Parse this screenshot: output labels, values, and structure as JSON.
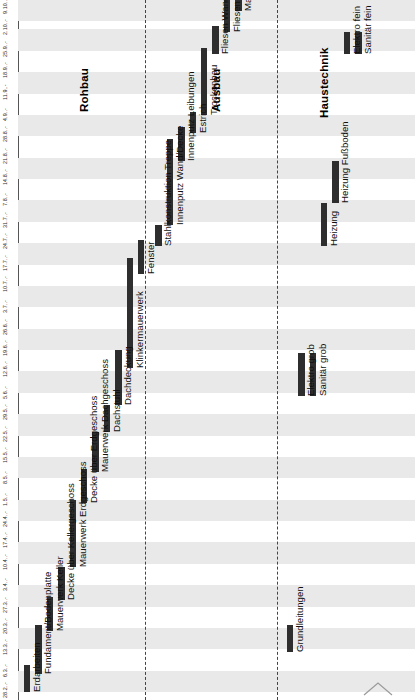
{
  "chart_data": {
    "type": "bar",
    "orientation": "gantt-rotated-90",
    "title": "",
    "xlabel": "",
    "ylabel": "",
    "time_axis": {
      "label": "",
      "ticks": [
        "28.2.",
        "6.3.",
        "13.3.",
        "20.3.",
        "27.3.",
        "3.4.",
        "10.4.",
        "17.4.",
        "24.4.",
        "1.5.",
        "8.5.",
        "15.5.",
        "22.5.",
        "29.5.",
        "5.6.",
        "12.6.",
        "19.6.",
        "26.6.",
        "3.7.",
        "10.7.",
        "17.7.",
        "24.7.",
        "31.7.",
        "7.8.",
        "14.8.",
        "21.8.",
        "28.8.",
        "4.9.",
        "11.9.",
        "18.9.",
        "25.9.",
        "2.10.",
        "9.10."
      ],
      "start": "28.2.",
      "end": "9.10."
    },
    "groups": [
      {
        "name": "Rohbau"
      },
      {
        "name": "Ausbau"
      },
      {
        "name": "Haustechnik"
      }
    ],
    "tasks": [
      {
        "group": "Rohbau",
        "label": "Erdarbeiten",
        "start": "28.2.",
        "end": "9.3."
      },
      {
        "group": "Rohbau",
        "label": "Fundament/Bodenplatte",
        "start": "6.3.",
        "end": "22.3."
      },
      {
        "group": "Rohbau",
        "label": "Mauerwerk Keller",
        "start": "20.3.",
        "end": "31.3."
      },
      {
        "group": "Rohbau",
        "label": "Decke über Kellergeschoss",
        "start": "30.3.",
        "end": "10.4."
      },
      {
        "group": "Rohbau",
        "label": "Mauerwerk Erdgeschoss",
        "start": "10.4.",
        "end": "2.5."
      },
      {
        "group": "Rohbau",
        "label": "Decke über Erdgeschoss",
        "start": "1.5.",
        "end": "12.5."
      },
      {
        "group": "Rohbau",
        "label": "Mauerwerk Dachgeschoss",
        "start": "11.5.",
        "end": "24.5."
      },
      {
        "group": "Rohbau",
        "label": "Dachstuhl",
        "start": "24.5.",
        "end": "2.6."
      },
      {
        "group": "Rohbau",
        "label": "Dachdeckung",
        "start": "2.6.",
        "end": "20.6."
      },
      {
        "group": "Rohbau",
        "label": "Klinkermauerwerk",
        "start": "14.6.",
        "end": "20.7."
      },
      {
        "group": "Rohbau",
        "label": "Fenster",
        "start": "15.7.",
        "end": "26.7."
      },
      {
        "group": "Ausbau",
        "label": "Stahlkonstruktion Treppe",
        "start": "24.7.",
        "end": "31.7."
      },
      {
        "group": "Ausbau",
        "label": "Innenputz Wand/Decke",
        "start": "31.7.",
        "end": "28.8."
      },
      {
        "group": "Ausbau",
        "label": "Innenputz Leibungen",
        "start": "21.8.",
        "end": "1.9."
      },
      {
        "group": "Ausbau",
        "label": "Estrich",
        "start": "30.8.",
        "end": "6.9."
      },
      {
        "group": "Ausbau",
        "label": "Trockenbau",
        "start": "5.9.",
        "end": "27.9."
      },
      {
        "group": "Ausbau",
        "label": "Fliesen Wand",
        "start": "25.9.",
        "end": "4.10."
      },
      {
        "group": "Ausbau",
        "label": "Fliesen Boden",
        "start": "2.10.",
        "end": "18.10."
      },
      {
        "group": "Ausbau",
        "label": "Maler",
        "start": "9.10.",
        "end": "30.10."
      },
      {
        "group": "Ausbau",
        "label": "Innentüren",
        "start": "23.10.",
        "end": "30.10."
      },
      {
        "group": "Ausbau",
        "label": "Holzkonstruktion",
        "start": "30.10.",
        "end": "6.11."
      },
      {
        "group": "Ausbau",
        "label": "Bodenbelag",
        "start": "30.10.",
        "end": "13.11."
      },
      {
        "group": "Haustechnik",
        "label": "Grundleitungen",
        "start": "13.3.",
        "end": "22.3."
      },
      {
        "group": "Haustechnik",
        "label": "Elektro grob",
        "start": "5.6.",
        "end": "19.6."
      },
      {
        "group": "Haustechnik",
        "label": "Sanitär grob",
        "start": "5.6.",
        "end": "19.6."
      },
      {
        "group": "Haustechnik",
        "label": "Heizung",
        "start": "24.7.",
        "end": "7.8."
      },
      {
        "group": "Haustechnik",
        "label": "Heizung Fußboden",
        "start": "7.8.",
        "end": "21.8."
      },
      {
        "group": "Haustechnik",
        "label": "Elektro fein",
        "start": "25.9.",
        "end": "2.10."
      },
      {
        "group": "Haustechnik",
        "label": "Sanitär fein",
        "start": "25.9.",
        "end": "2.10."
      }
    ],
    "colors": {
      "bar": "#2e2e2e",
      "band": "#e9e9e9",
      "background": "#ffffff",
      "axis": "#555555",
      "separator": "#444444"
    },
    "grid": true,
    "legend": "none"
  }
}
